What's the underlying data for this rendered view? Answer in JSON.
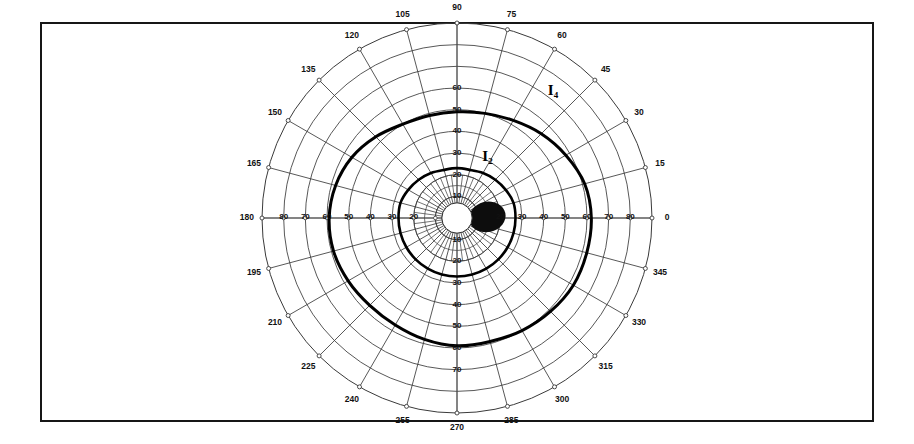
{
  "figure": {
    "type": "goldmann-visual-field-perimetry",
    "border_color": "#161616",
    "background_color": "#ffffff",
    "grid_color": "#3a3a3a",
    "isopter_color": "#000000",
    "scotoma_color": "#0d0d0d"
  },
  "chart_data": {
    "type": "line",
    "title": "",
    "subtitle": "",
    "xlabel": "",
    "ylabel": "",
    "coordinate_system": "polar",
    "grid": true,
    "legend_position": "inline-annotation",
    "angle_unit": "degrees",
    "radius_unit": "degrees of eccentricity",
    "radial_range": [
      0,
      90
    ],
    "radial_tick_step": 10,
    "radial_ticks": [
      10,
      20,
      30,
      40,
      50,
      60,
      70,
      80,
      90
    ],
    "meridian_step": 15,
    "meridian_ticks": [
      0,
      15,
      30,
      45,
      60,
      75,
      90,
      105,
      120,
      135,
      150,
      165,
      180,
      195,
      210,
      225,
      240,
      255,
      270,
      285,
      300,
      315,
      330,
      345
    ],
    "angle_labels": {
      "top": [
        "120",
        "105",
        "90",
        "75",
        "60"
      ],
      "right": [
        "45",
        "30",
        "15",
        "0",
        "345",
        "330",
        "315"
      ],
      "bottom": [
        "300",
        "285",
        "270",
        "255",
        "240"
      ],
      "left": [
        "225",
        "210",
        "195",
        "180",
        "165",
        "150",
        "135"
      ]
    },
    "radial_labels": {
      "left_horizontal": [
        "80",
        "70",
        "60",
        "50",
        "40",
        "30",
        "20"
      ],
      "right_horizontal": [
        "20",
        "30",
        "40",
        "50",
        "60",
        "70",
        "80"
      ],
      "up_vertical": [
        "10",
        "20",
        "30",
        "40",
        "50",
        "60"
      ],
      "down_vertical": [
        "10",
        "20",
        "30",
        "40",
        "50",
        "60",
        "70"
      ]
    },
    "axis_origin_labels": {
      "left_end": "180",
      "right_end": "0",
      "top_end": "90",
      "bottom_end": "270"
    },
    "series": [
      {
        "name": "I4",
        "label": "I₄",
        "label_text": "I",
        "label_subscript": "4",
        "stimulus": "I4e",
        "kind": "isopter",
        "line_width_px": 3,
        "label_angle_deg": 52,
        "label_radius_deg": 72,
        "points_polar": [
          {
            "angle": 0,
            "radius": 62
          },
          {
            "angle": 15,
            "radius": 61
          },
          {
            "angle": 30,
            "radius": 58
          },
          {
            "angle": 45,
            "radius": 55
          },
          {
            "angle": 60,
            "radius": 52
          },
          {
            "angle": 75,
            "radius": 50
          },
          {
            "angle": 90,
            "radius": 49
          },
          {
            "angle": 105,
            "radius": 49
          },
          {
            "angle": 120,
            "radius": 50
          },
          {
            "angle": 135,
            "radius": 53
          },
          {
            "angle": 150,
            "radius": 56
          },
          {
            "angle": 165,
            "radius": 58
          },
          {
            "angle": 180,
            "radius": 59
          },
          {
            "angle": 195,
            "radius": 59
          },
          {
            "angle": 210,
            "radius": 58
          },
          {
            "angle": 225,
            "radius": 57
          },
          {
            "angle": 240,
            "radius": 57
          },
          {
            "angle": 255,
            "radius": 58
          },
          {
            "angle": 270,
            "radius": 59
          },
          {
            "angle": 285,
            "radius": 59
          },
          {
            "angle": 300,
            "radius": 60
          },
          {
            "angle": 315,
            "radius": 61
          },
          {
            "angle": 330,
            "radius": 62
          },
          {
            "angle": 345,
            "radius": 62
          }
        ]
      },
      {
        "name": "I2",
        "label": "I₂",
        "label_text": "I",
        "label_subscript": "2",
        "stimulus": "I2e",
        "kind": "isopter",
        "line_width_px": 2.6,
        "label_angle_deg": 62,
        "label_radius_deg": 30,
        "points_polar": [
          {
            "angle": 0,
            "radius": 27
          },
          {
            "angle": 15,
            "radius": 27
          },
          {
            "angle": 30,
            "radius": 26
          },
          {
            "angle": 45,
            "radius": 25
          },
          {
            "angle": 60,
            "radius": 24
          },
          {
            "angle": 75,
            "radius": 23
          },
          {
            "angle": 90,
            "radius": 23
          },
          {
            "angle": 105,
            "radius": 23
          },
          {
            "angle": 120,
            "radius": 24
          },
          {
            "angle": 135,
            "radius": 25
          },
          {
            "angle": 150,
            "radius": 26
          },
          {
            "angle": 165,
            "radius": 27
          },
          {
            "angle": 180,
            "radius": 27
          },
          {
            "angle": 195,
            "radius": 27
          },
          {
            "angle": 210,
            "radius": 27
          },
          {
            "angle": 225,
            "radius": 27
          },
          {
            "angle": 240,
            "radius": 27
          },
          {
            "angle": 255,
            "radius": 27
          },
          {
            "angle": 270,
            "radius": 27
          },
          {
            "angle": 285,
            "radius": 27
          },
          {
            "angle": 300,
            "radius": 27
          },
          {
            "angle": 315,
            "radius": 27
          },
          {
            "angle": 330,
            "radius": 27
          },
          {
            "angle": 345,
            "radius": 27
          }
        ]
      }
    ],
    "annotations": [
      {
        "name": "blind-spot",
        "type": "filled-scotoma",
        "shape": "ellipse",
        "center_angle_deg": 2,
        "center_radius_deg": 14,
        "semi_major_deg": 8.5,
        "semi_minor_deg": 7.0,
        "fill": "#0d0d0d"
      },
      {
        "name": "fixation-point",
        "type": "open-circle",
        "center_angle_deg": 0,
        "center_radius_deg": 0,
        "radius_deg": 7,
        "fill": "#ffffff"
      }
    ]
  }
}
